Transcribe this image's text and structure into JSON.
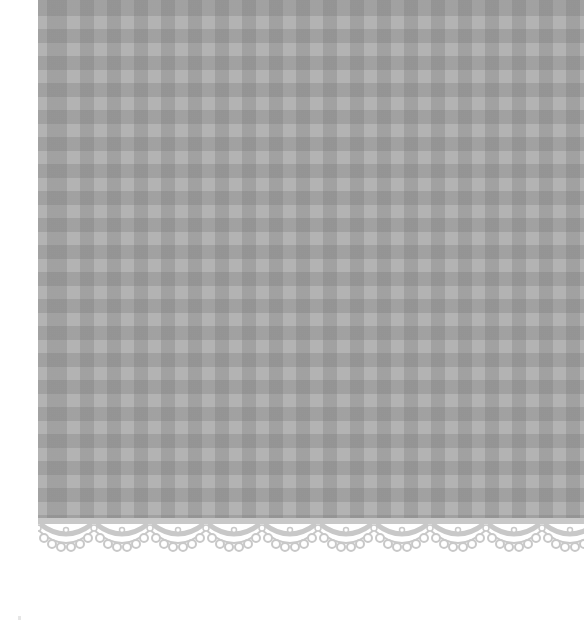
{
  "image": {
    "description": "Gray gingham check fabric with scalloped lace trim along the bottom edge on a white background",
    "colors": {
      "background": "#ffffff",
      "fabric_base": "#b3b3b3",
      "fabric_check": "#9a9a9a",
      "lace": "#c8c8c8"
    },
    "pattern": {
      "type": "gingham",
      "check_period_px": 27
    },
    "lace_trim": {
      "scallop_period_px": 56
    }
  }
}
